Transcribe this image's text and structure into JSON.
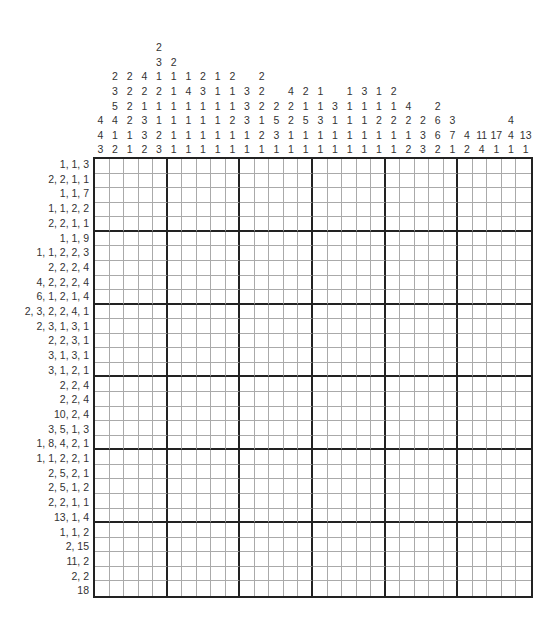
{
  "puzzle": {
    "type": "nonogram",
    "width": 30,
    "height": 30,
    "block_size": 5,
    "column_clues": [
      [
        4,
        4,
        3
      ],
      [
        2,
        3,
        5,
        4,
        1,
        2
      ],
      [
        2,
        2,
        2,
        2,
        1,
        1
      ],
      [
        4,
        2,
        1,
        3,
        3,
        2
      ],
      [
        2,
        3,
        1,
        2,
        1,
        1,
        2,
        3
      ],
      [
        2,
        1,
        1,
        1,
        1,
        1,
        1
      ],
      [
        1,
        4,
        1,
        1,
        1,
        1
      ],
      [
        2,
        3,
        1,
        1,
        1,
        1
      ],
      [
        1,
        1,
        1,
        1,
        1,
        1
      ],
      [
        2,
        1,
        1,
        2,
        1,
        1
      ],
      [
        3,
        3,
        3,
        1,
        1
      ],
      [
        2,
        2,
        2,
        1,
        2,
        1
      ],
      [
        2,
        5,
        3,
        1
      ],
      [
        4,
        2,
        2,
        1,
        1
      ],
      [
        2,
        1,
        5,
        1,
        1
      ],
      [
        1,
        1,
        3,
        1,
        1
      ],
      [
        3,
        1,
        1,
        1
      ],
      [
        1,
        1,
        1,
        1,
        1
      ],
      [
        3,
        1,
        1,
        1,
        1
      ],
      [
        1,
        1,
        2,
        1,
        1
      ],
      [
        2,
        1,
        2,
        1,
        1
      ],
      [
        4,
        2,
        1,
        2
      ],
      [
        2,
        3,
        3
      ],
      [
        2,
        6,
        6,
        2
      ],
      [
        3,
        7,
        1
      ],
      [
        4,
        2
      ],
      [
        11,
        4
      ],
      [
        17,
        1
      ],
      [
        4,
        4,
        1
      ],
      [
        13,
        1
      ]
    ],
    "row_clues": [
      "1, 1, 3",
      "2, 2, 1, 1",
      "1, 1, 7",
      "1, 1, 2, 2",
      "2, 2, 1, 1",
      "1, 1, 9",
      "1, 1, 2, 2, 3",
      "2, 2, 2, 4",
      "4, 2, 2, 2, 4",
      "6, 1, 2, 1, 4",
      "2, 3, 2, 2, 4, 1",
      "2, 3, 1, 3, 1",
      "2, 2, 3, 1",
      "3, 1, 3, 1",
      "3, 1, 2, 1",
      "2, 2, 4",
      "2, 2, 4",
      "10, 2, 4",
      "3, 5, 1, 3",
      "1, 8, 4, 2, 1",
      "1, 1, 2, 2, 1",
      "2, 5, 2, 1",
      "2, 5, 1, 2",
      "2, 2, 1, 1",
      "13, 1, 4",
      "1, 1, 2",
      "2, 15",
      "11, 2",
      "2, 2",
      "18"
    ]
  }
}
